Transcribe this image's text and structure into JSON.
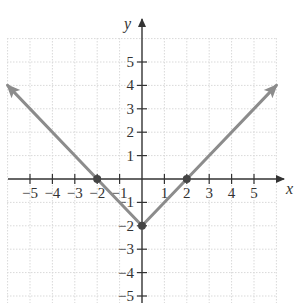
{
  "chart_data": {
    "type": "line",
    "title": "",
    "function": "y = |x| - 2",
    "xlabel": "x",
    "ylabel": "y",
    "xlim": [
      -6,
      6
    ],
    "ylim": [
      -5.5,
      6
    ],
    "grid": true,
    "x_ticks": [
      -5,
      -4,
      -3,
      -2,
      -1,
      1,
      2,
      3,
      4,
      5
    ],
    "x_tick_labels": [
      "−5",
      "−4",
      "−3",
      "−2",
      "−1",
      "1",
      "2",
      "3",
      "4",
      "5"
    ],
    "y_ticks": [
      5,
      4,
      3,
      2,
      1,
      -1,
      -2,
      -3,
      -4,
      -5
    ],
    "y_tick_labels": [
      "5",
      "4",
      "3",
      "2",
      "1",
      "−1",
      "−2",
      "−3",
      "−4",
      "−5"
    ],
    "series": [
      {
        "name": "y = |x| - 2",
        "color": "#8c8c8c",
        "x": [
          -6,
          -2,
          0,
          2,
          6
        ],
        "y": [
          4,
          0,
          -2,
          0,
          4
        ],
        "arrows_at_ends": true
      }
    ],
    "points": [
      {
        "x": -2,
        "y": 0,
        "label": "x-intercept"
      },
      {
        "x": 0,
        "y": -2,
        "label": "vertex / y-intercept"
      },
      {
        "x": 2,
        "y": 0,
        "label": "x-intercept"
      }
    ]
  },
  "colors": {
    "axis": "#333333",
    "grid": "#d9d9d9",
    "curve": "#8c8c8c",
    "point": "#444444"
  }
}
